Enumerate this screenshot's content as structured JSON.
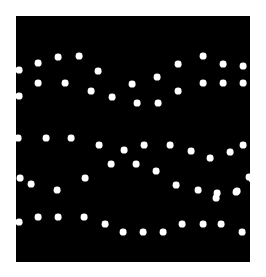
{
  "image": {
    "width": 266,
    "height": 277,
    "background_color": "#ffffff",
    "title": "White dot pattern on black square"
  },
  "plot": {
    "x": 16,
    "y": 16,
    "width": 234,
    "height": 246,
    "fill_color": "#000000",
    "dot_color": "#ffffff",
    "dot_radius": 3.4
  },
  "chart_data": {
    "type": "scatter",
    "title": "",
    "xlabel": "",
    "ylabel": "",
    "xlim": [
      16,
      250
    ],
    "ylim": [
      16,
      262
    ],
    "grid": false,
    "legend": null,
    "marker": "circle",
    "marker_color": "#ffffff",
    "marker_radius": 3.4,
    "background_color": "#000000",
    "point_count": 78,
    "points": [
      [
        19,
        70
      ],
      [
        38,
        63
      ],
      [
        58,
        57
      ],
      [
        79,
        56
      ],
      [
        98,
        71
      ],
      [
        38,
        83
      ],
      [
        65,
        83
      ],
      [
        19,
        96
      ],
      [
        91,
        91
      ],
      [
        112,
        97
      ],
      [
        132,
        84
      ],
      [
        157,
        77
      ],
      [
        178,
        64
      ],
      [
        203,
        56
      ],
      [
        223,
        64
      ],
      [
        243,
        66
      ],
      [
        178,
        91
      ],
      [
        203,
        83
      ],
      [
        223,
        83
      ],
      [
        243,
        83
      ],
      [
        137,
        103
      ],
      [
        158,
        103
      ],
      [
        18,
        138
      ],
      [
        46,
        138
      ],
      [
        71,
        138
      ],
      [
        99,
        145
      ],
      [
        124,
        150
      ],
      [
        111,
        164
      ],
      [
        144,
        145
      ],
      [
        170,
        145
      ],
      [
        191,
        151
      ],
      [
        210,
        158
      ],
      [
        230,
        152
      ],
      [
        243,
        145
      ],
      [
        136,
        164
      ],
      [
        156,
        171
      ],
      [
        20,
        178
      ],
      [
        31,
        184
      ],
      [
        57,
        190
      ],
      [
        85,
        178
      ],
      [
        176,
        185
      ],
      [
        198,
        190
      ],
      [
        216,
        198
      ],
      [
        237,
        191
      ],
      [
        249,
        177
      ],
      [
        252,
        179
      ],
      [
        19,
        222
      ],
      [
        38,
        217
      ],
      [
        58,
        217
      ],
      [
        84,
        217
      ],
      [
        105,
        224
      ],
      [
        123,
        232
      ],
      [
        143,
        232
      ],
      [
        163,
        232
      ],
      [
        182,
        224
      ],
      [
        203,
        224
      ],
      [
        221,
        224
      ],
      [
        242,
        232
      ],
      [
        217,
        193
      ],
      [
        236,
        192
      ]
    ]
  }
}
